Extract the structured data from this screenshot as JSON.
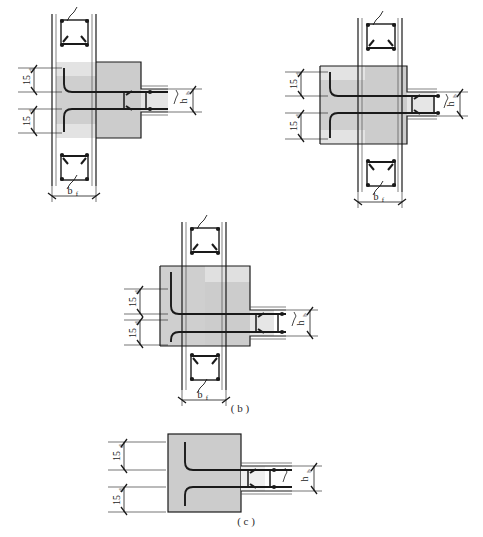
{
  "figure": {
    "background_color": "#ffffff",
    "concrete_fill_color": "#cccccc",
    "concrete_fill_light_color": "#e0e0e0",
    "line_color": "#1a1a1a",
    "rebar_color": "#1a1a1a",
    "thin_line_color": "#4d4d4d"
  },
  "captions": {
    "a": "",
    "b": "( b )",
    "c": "( c )"
  },
  "labels": {
    "hook_length": "15",
    "hook_length_symbol": "d",
    "flange_width": "b",
    "flange_width_sub": "f",
    "beam_depth": "h",
    "beam_depth_sub": "b"
  },
  "details": [
    {
      "id": "detail-a-left",
      "name": "exterior-joint-top-left",
      "caption": "",
      "dimensions": [
        {
          "name": "hook-upper",
          "text": "15d",
          "orientation": "vertical"
        },
        {
          "name": "hook-lower",
          "text": "15d",
          "orientation": "vertical"
        },
        {
          "name": "flange-width",
          "text": "bf",
          "orientation": "horizontal"
        },
        {
          "name": "beam-depth",
          "text": "hb",
          "orientation": "vertical"
        }
      ]
    },
    {
      "id": "detail-a-right",
      "name": "interior-joint-top-right",
      "caption": "",
      "dimensions": [
        {
          "name": "hook-upper",
          "text": "15d",
          "orientation": "vertical"
        },
        {
          "name": "hook-lower",
          "text": "15d",
          "orientation": "vertical"
        },
        {
          "name": "flange-width",
          "text": "bf",
          "orientation": "horizontal"
        },
        {
          "name": "beam-depth",
          "text": "hb",
          "orientation": "vertical"
        }
      ]
    },
    {
      "id": "detail-b",
      "name": "corner-joint-middle",
      "caption": "( b )",
      "dimensions": [
        {
          "name": "hook-upper",
          "text": "15d",
          "orientation": "vertical"
        },
        {
          "name": "hook-lower",
          "text": "15d",
          "orientation": "vertical"
        },
        {
          "name": "flange-width",
          "text": "bf",
          "orientation": "horizontal"
        },
        {
          "name": "beam-depth",
          "text": "hb",
          "orientation": "vertical"
        }
      ]
    },
    {
      "id": "detail-c",
      "name": "wall-end-joint-bottom",
      "caption": "( c )",
      "dimensions": [
        {
          "name": "hook-upper",
          "text": "15d",
          "orientation": "vertical"
        },
        {
          "name": "hook-lower",
          "text": "15d",
          "orientation": "vertical"
        },
        {
          "name": "beam-depth",
          "text": "hb",
          "orientation": "vertical"
        }
      ]
    }
  ]
}
